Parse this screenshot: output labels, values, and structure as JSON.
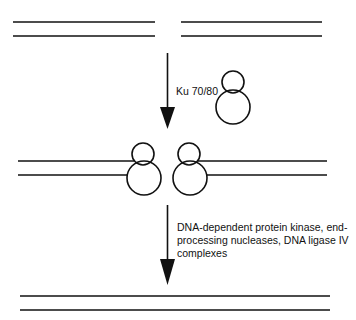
{
  "diagram": {
    "colors": {
      "stroke": "#111111",
      "background": "#ffffff"
    },
    "steps": [
      {
        "name": "broken-dna",
        "description": "Double-strand break: two separated DNA duplexes"
      },
      {
        "name": "ku-binding",
        "arrow_label": "Ku 70/80",
        "description": "Ku 70/80 heterodimer binds both DNA ends"
      },
      {
        "name": "ligation",
        "arrow_label": "DNA-dependent protein kinase, end-processing nucleases, DNA ligase IV complexes",
        "description": "Rejoined continuous DNA duplex"
      }
    ],
    "labels": {
      "ku": "Ku 70/80",
      "complexes": "DNA-dependent protein kinase, end-processing nucleases, DNA ligase IV complexes"
    }
  }
}
